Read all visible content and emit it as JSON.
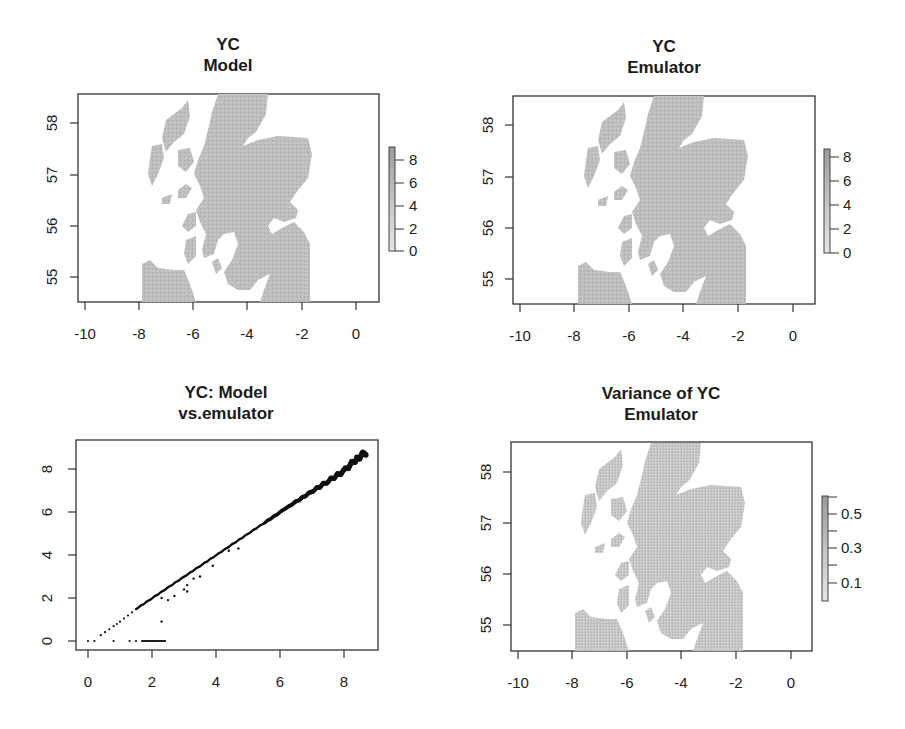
{
  "figure": {
    "panels": [
      {
        "id": "yc-model",
        "title_line1": "YC",
        "title_line2": "Model",
        "type": "map",
        "xticks": [
          "-10",
          "-8",
          "-6",
          "-4",
          "-2",
          "0"
        ],
        "yticks": [
          "58",
          "57",
          "56",
          "55"
        ],
        "colorbar_ticks": [
          "8",
          "6",
          "4",
          "2",
          "0"
        ]
      },
      {
        "id": "yc-emulator",
        "title_line1": "YC",
        "title_line2": "Emulator",
        "type": "map",
        "xticks": [
          "-10",
          "-8",
          "-6",
          "-4",
          "-2",
          "0"
        ],
        "yticks": [
          "58",
          "57",
          "56",
          "55"
        ],
        "colorbar_ticks": [
          "8",
          "6",
          "4",
          "2",
          "0"
        ]
      },
      {
        "id": "yc-scatter",
        "title_line1": "YC: Model",
        "title_line2": "vs.emulator",
        "type": "scatter",
        "xticks": [
          "0",
          "2",
          "4",
          "6",
          "8"
        ],
        "yticks": [
          "8",
          "6",
          "4",
          "2",
          "0"
        ]
      },
      {
        "id": "yc-variance",
        "title_line1": "Variance of YC",
        "title_line2": "Emulator",
        "type": "map",
        "xticks": [
          "-10",
          "-8",
          "-6",
          "-4",
          "-2",
          "0"
        ],
        "yticks": [
          "58",
          "57",
          "56",
          "55"
        ],
        "colorbar_ticks": [
          "0.5",
          "0.3",
          "0.1"
        ]
      }
    ],
    "colors": {
      "axis": "#333333",
      "land_fill": "#b9b9b9",
      "land_fill_variance": "#c4c4c4",
      "points": "#111111",
      "colorbar_fill": "#a8a8a8"
    }
  },
  "chart_data": [
    {
      "type": "heatmap",
      "title": "YC Model",
      "xlabel": "",
      "ylabel": "",
      "xlim": [
        -10.3,
        0.9
      ],
      "ylim": [
        54.5,
        58.6
      ],
      "x_ticks": [
        -10,
        -8,
        -6,
        -4,
        -2,
        0
      ],
      "y_ticks": [
        55,
        56,
        57,
        58
      ],
      "colorbar": {
        "min": 0,
        "max": 9,
        "ticks": [
          0,
          2,
          4,
          6,
          8
        ]
      },
      "description": "Grayscale raster of yield class over Scotland; land cells only, values mostly 2-8"
    },
    {
      "type": "heatmap",
      "title": "YC Emulator",
      "xlabel": "",
      "ylabel": "",
      "xlim": [
        -10.3,
        0.9
      ],
      "ylim": [
        54.5,
        58.6
      ],
      "x_ticks": [
        -10,
        -8,
        -6,
        -4,
        -2,
        0
      ],
      "y_ticks": [
        55,
        56,
        57,
        58
      ],
      "colorbar": {
        "min": 0,
        "max": 9,
        "ticks": [
          0,
          2,
          4,
          6,
          8
        ]
      },
      "description": "Emulator-predicted yield class over Scotland, visually near-identical to model"
    },
    {
      "type": "scatter",
      "title": "YC: Model vs.emulator",
      "xlabel": "",
      "ylabel": "",
      "xlim": [
        -0.4,
        9.0
      ],
      "ylim": [
        -0.4,
        9.3
      ],
      "x_ticks": [
        0,
        2,
        4,
        6,
        8
      ],
      "y_ticks": [
        0,
        2,
        4,
        6,
        8
      ],
      "series": [
        {
          "name": "main diagonal band",
          "x": [
            0.4,
            0.8,
            1.0,
            1.5,
            2.0,
            2.5,
            3.0,
            3.5,
            4.0,
            4.5,
            5.0,
            5.5,
            6.0,
            6.5,
            7.0,
            7.5,
            8.0,
            8.4,
            8.7
          ],
          "y": [
            0.3,
            0.7,
            0.9,
            1.5,
            2.0,
            2.5,
            3.0,
            3.5,
            4.0,
            4.5,
            5.0,
            5.5,
            6.0,
            6.5,
            7.0,
            7.5,
            8.0,
            8.6,
            8.9
          ]
        },
        {
          "name": "outliers below diagonal",
          "x": [
            2.3,
            2.5,
            2.7,
            3.0,
            3.1,
            3.1,
            3.3,
            3.5,
            3.9,
            4.4,
            4.7,
            2.3
          ],
          "y": [
            2.0,
            1.9,
            2.1,
            2.4,
            2.6,
            2.3,
            2.9,
            3.0,
            3.5,
            4.2,
            4.3,
            0.9
          ]
        },
        {
          "name": "zero-emulator points",
          "x": [
            0.0,
            0.2,
            0.8,
            1.3,
            1.5,
            1.7,
            1.8,
            1.9,
            2.0,
            2.1,
            2.2,
            2.3,
            2.4
          ],
          "y": [
            0,
            0,
            0,
            0,
            0,
            0,
            0,
            0,
            0,
            0,
            0,
            0,
            0
          ]
        }
      ]
    },
    {
      "type": "heatmap",
      "title": "Variance of YC Emulator",
      "xlabel": "",
      "ylabel": "",
      "xlim": [
        -10.3,
        0.9
      ],
      "ylim": [
        54.5,
        58.6
      ],
      "x_ticks": [
        -10,
        -8,
        -6,
        -4,
        -2,
        0
      ],
      "y_ticks": [
        55,
        56,
        57,
        58
      ],
      "colorbar": {
        "min": 0.0,
        "max": 0.6,
        "ticks": [
          0.1,
          0.2,
          0.3,
          0.4,
          0.5,
          0.6
        ],
        "labeled_ticks": [
          0.1,
          0.3,
          0.5
        ]
      },
      "description": "Emulator variance over Scotland, speckled grayscale"
    }
  ]
}
